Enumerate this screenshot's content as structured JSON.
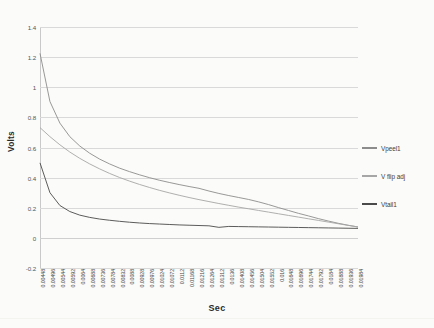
{
  "chart_data": {
    "type": "line",
    "title": "",
    "xlabel": "Sec",
    "ylabel": "Volts",
    "ylim": [
      -0.2,
      1.4
    ],
    "ytick_labels": [
      "1.4",
      "1.2",
      "1",
      "0.8",
      "0.6",
      "0.4",
      "0.2",
      "0",
      "-0.2"
    ],
    "ytick_values": [
      1.4,
      1.2,
      1,
      0.8,
      0.6,
      0.4,
      0.2,
      0,
      -0.2
    ],
    "grid": "horizontal",
    "legend_position": "right",
    "x_tick_labels": [
      "0.00448",
      "0.00496",
      "0.00544",
      "0.00592",
      "0.0064",
      "0.00688",
      "0.00736",
      "0.00784",
      "0.00832",
      "0.0088",
      "0.00928",
      "0.00976",
      "0.01024",
      "0.01072",
      "0.0112",
      "0.01168",
      "0.01216",
      "0.01264",
      "0.01312",
      "0.0136",
      "0.01408",
      "0.01456",
      "0.01504",
      "0.01552",
      "0.016",
      "0.01648",
      "0.01696",
      "0.01744",
      "0.01792",
      "0.0184",
      "0.01888",
      "0.01936",
      "0.01984"
    ],
    "x": [
      0.00448,
      0.00496,
      0.00544,
      0.00592,
      0.0064,
      0.00688,
      0.00736,
      0.00784,
      0.00832,
      0.0088,
      0.00928,
      0.00976,
      0.01024,
      0.01072,
      0.0112,
      0.01168,
      0.01216,
      0.01264,
      0.01312,
      0.0136,
      0.01408,
      0.01456,
      0.01504,
      0.01552,
      0.016,
      0.01648,
      0.01696,
      0.01744,
      0.01792,
      0.0184,
      0.01888,
      0.01936,
      0.01984
    ],
    "series": [
      {
        "name": "Vpeel1",
        "color": "#8c8c8c",
        "values": [
          1.225,
          0.905,
          0.762,
          0.672,
          0.61,
          0.562,
          0.523,
          0.491,
          0.463,
          0.44,
          0.419,
          0.4,
          0.383,
          0.368,
          0.354,
          0.341,
          0.329,
          0.311,
          0.295,
          0.281,
          0.268,
          0.255,
          0.239,
          0.221,
          0.201,
          0.182,
          0.163,
          0.146,
          0.128,
          0.112,
          0.097,
          0.084,
          0.072
        ]
      },
      {
        "name": "V flip adj",
        "color": "#a6a6a6",
        "values": [
          0.732,
          0.672,
          0.618,
          0.57,
          0.528,
          0.491,
          0.458,
          0.428,
          0.401,
          0.377,
          0.355,
          0.335,
          0.316,
          0.299,
          0.283,
          0.268,
          0.254,
          0.241,
          0.228,
          0.216,
          0.204,
          0.193,
          0.182,
          0.171,
          0.16,
          0.149,
          0.138,
          0.127,
          0.116,
          0.105,
          0.094,
          0.083,
          0.073
        ]
      },
      {
        "name": "Vtail1",
        "color": "#4a4a4a",
        "values": [
          0.498,
          0.3,
          0.215,
          0.175,
          0.151,
          0.136,
          0.125,
          0.117,
          0.11,
          0.104,
          0.099,
          0.095,
          0.092,
          0.089,
          0.086,
          0.084,
          0.082,
          0.08,
          0.07,
          0.076,
          0.075,
          0.074,
          0.073,
          0.072,
          0.071,
          0.07,
          0.069,
          0.068,
          0.067,
          0.066,
          0.065,
          0.064,
          0.063
        ]
      }
    ]
  },
  "legend": {
    "items": [
      {
        "label": "Vpeel1",
        "color": "#8c8c8c"
      },
      {
        "label": "V flip adj",
        "color": "#a6a6a6"
      },
      {
        "label": "Vtail1",
        "color": "#4a4a4a"
      }
    ]
  }
}
